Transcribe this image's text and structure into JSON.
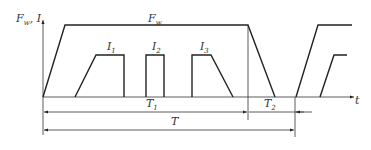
{
  "diagram": {
    "y_axis_label": "F",
    "y_axis_label_sub": "w",
    "y_axis_label_suffix": ", I",
    "x_axis_label": "t",
    "curves": {
      "force": {
        "label": "F",
        "label_sub": "w"
      },
      "current_1": {
        "label": "I",
        "label_sub": "1"
      },
      "current_2": {
        "label": "I",
        "label_sub": "2"
      },
      "current_3": {
        "label": "I",
        "label_sub": "3"
      }
    },
    "intervals": {
      "t1": {
        "label": "T",
        "label_sub": "1"
      },
      "t2": {
        "label": "T",
        "label_sub": "2"
      },
      "t": {
        "label": "T"
      }
    }
  }
}
